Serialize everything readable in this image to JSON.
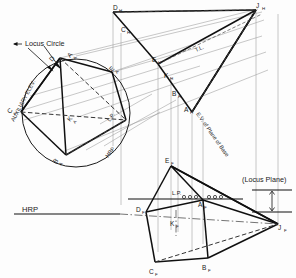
{
  "drawing": {
    "title": "Locus Circle Auxiliary Elevation Construction",
    "background_color": "#fdfdfd",
    "object_line_color": "#111111",
    "projection_line_color": "#8d8d8d",
    "hidden_line_color": "#444444",
    "notes": {
      "locus_circle": "Locus Circle",
      "auxiliary_elev": "AUXILIARY  ELEV.",
      "locus_plane": "(Locus Plane)",
      "ev_plane_of_base": "E.V. of Plane of Base",
      "true_length": "T.L.",
      "locus_plane_short_top": "L.P.",
      "locus_plane_short_front": "L.P.",
      "hrp_upper": "HRP",
      "hrp_lower": "HRP"
    },
    "points_top_view": [
      {
        "id": "D_H",
        "letter": "D",
        "sub": "H",
        "x": 113,
        "y": 10
      },
      {
        "id": "J_H",
        "letter": "J",
        "sub": "H",
        "x": 256,
        "y": 8
      },
      {
        "id": "C_H",
        "letter": "C",
        "sub": "H",
        "x": 121,
        "y": 32
      },
      {
        "id": "E_H",
        "letter": "E",
        "sub": "H",
        "x": 158,
        "y": 62
      },
      {
        "id": "K_H",
        "letter": "K",
        "sub": "H",
        "x": 170,
        "y": 75
      },
      {
        "id": "B_H",
        "letter": "B",
        "sub": "H",
        "x": 178,
        "y": 95
      },
      {
        "id": "A_H",
        "letter": "A",
        "sub": "H",
        "x": 192,
        "y": 112
      }
    ],
    "points_aux_elev": [
      {
        "id": "D_A",
        "letter": "D",
        "sub": "A",
        "x": 56,
        "y": 62
      },
      {
        "id": "A_A",
        "letter": "A",
        "sub": "A",
        "x": 74,
        "y": 60
      },
      {
        "id": "E_A",
        "letter": "E",
        "sub": "A",
        "x": 108,
        "y": 74
      },
      {
        "id": "C_A",
        "letter": "C",
        "sub": "A",
        "x": 17,
        "y": 113
      },
      {
        "id": "K_A",
        "letter": "K",
        "sub": "A",
        "x": 75,
        "y": 119
      },
      {
        "id": "B_A",
        "letter": "B",
        "sub": "A",
        "x": 58,
        "y": 155
      }
    ],
    "points_front_view": [
      {
        "id": "E_F",
        "letter": "E",
        "sub": "F",
        "x": 171,
        "y": 163
      },
      {
        "id": "A_F",
        "letter": "A",
        "sub": "F",
        "x": 204,
        "y": 199
      },
      {
        "id": "K_F",
        "letter": "K",
        "sub": "F",
        "x": 176,
        "y": 224
      },
      {
        "id": "J_F",
        "letter": "J",
        "sub": "F",
        "x": 278,
        "y": 224
      },
      {
        "id": "D_F",
        "letter": "D",
        "sub": "F",
        "x": 142,
        "y": 213
      },
      {
        "id": "B_F",
        "letter": "B",
        "sub": "F",
        "x": 208,
        "y": 262
      },
      {
        "id": "C_F",
        "letter": "C",
        "sub": "F",
        "x": 155,
        "y": 266
      }
    ],
    "locus_circle": {
      "cx": 76,
      "cy": 113,
      "r": 54
    },
    "reference_lines": [
      {
        "name": "hrp-upper",
        "label": "HRP"
      },
      {
        "name": "hrp-lower",
        "label": "HRP"
      },
      {
        "name": "locus-plane-line",
        "label": "L.P."
      }
    ]
  }
}
